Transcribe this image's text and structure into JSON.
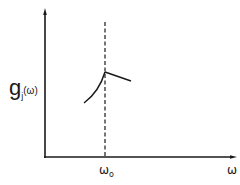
{
  "diagram": {
    "y_axis_label": {
      "main": "g",
      "subscript": "j",
      "argument": "(ω)"
    },
    "x_axis_label": "ω",
    "x_tick": {
      "main": "ω",
      "subscript": "o"
    },
    "colors": {
      "stroke": "#1a1a1a",
      "background": "#ffffff"
    },
    "elements": [
      "y-axis with arrow",
      "x-axis with arrow",
      "dashed vertical line at ω_o",
      "concave rising curve ending at peak on dashed line",
      "straight decreasing line from peak"
    ]
  }
}
